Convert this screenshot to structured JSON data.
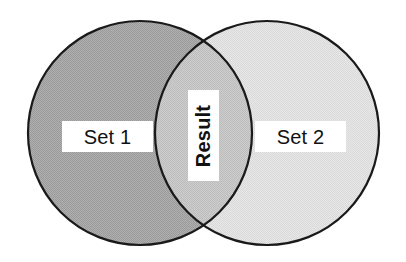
{
  "diagram": {
    "type": "venn-two-set",
    "title": "",
    "background_color": "#ffffff",
    "outline_color": "#1a1a1a",
    "left_circle": {
      "label": "Set 1",
      "fill_color": "#a9a9a9",
      "texture": "fine-dither-hatch",
      "center_x": 140,
      "center_y": 133,
      "radius": 112
    },
    "right_circle": {
      "label": "Set 2",
      "fill_color": "#e2e2e2",
      "texture": "fine-dither-hatch",
      "center_x": 267,
      "center_y": 133,
      "radius": 112
    },
    "intersection": {
      "label": "Result",
      "fill_color": "#c6c6c6",
      "label_rotation": "-90",
      "label_weight": "bold",
      "crossing_top_x": 205,
      "crossing_top_y": 45,
      "crossing_bottom_x": 205,
      "crossing_bottom_y": 222
    }
  }
}
